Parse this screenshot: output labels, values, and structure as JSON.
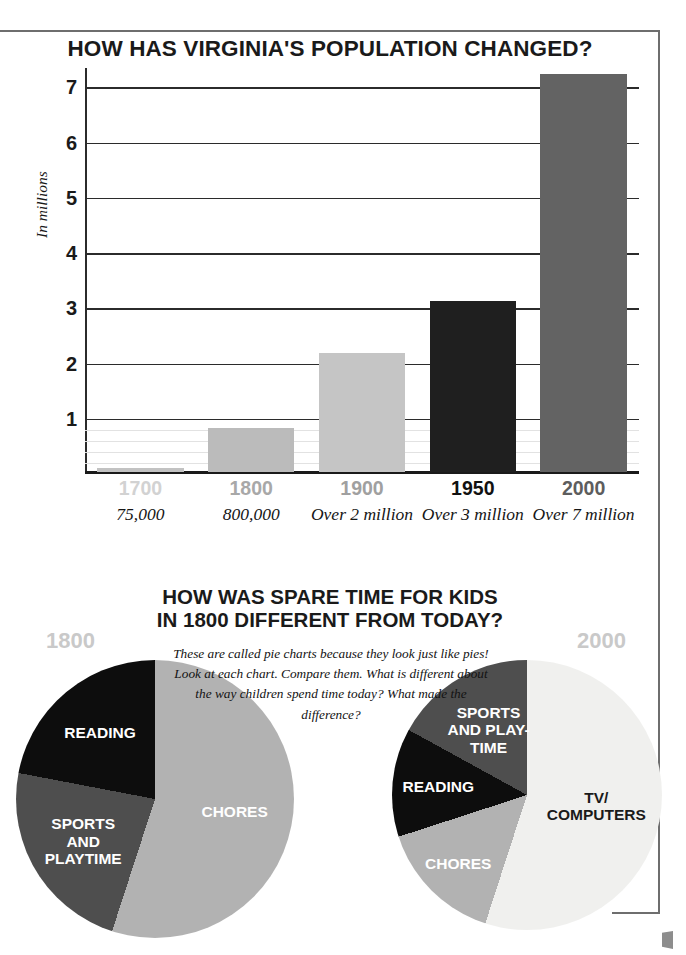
{
  "bar_section": {
    "title": "HOW HAS VIRGINIA'S POPULATION CHANGED?",
    "ylabel": "In millions"
  },
  "pie_section": {
    "title_line1": "HOW WAS SPARE TIME FOR KIDS",
    "title_line2": "IN 1800 DIFFERENT FROM TODAY?",
    "note": "These are called pie charts because they look just like pies! Look at each chart. Compare them. What is different about the way children spend time today? What made the difference?",
    "left_year": "1800",
    "right_year": "2000"
  },
  "chart_data": [
    {
      "type": "bar",
      "title": "HOW HAS VIRGINIA'S POPULATION CHANGED?",
      "xlabel": "",
      "ylabel": "In millions",
      "ylim": [
        0,
        7.35
      ],
      "yticks": [
        1,
        2,
        3,
        4,
        5,
        6,
        7
      ],
      "grid": true,
      "categories": [
        "1700",
        "1800",
        "1900",
        "1950",
        "2000"
      ],
      "values": [
        0.075,
        0.8,
        2.15,
        3.1,
        7.2
      ],
      "value_labels": [
        "75,000",
        "800,000",
        "Over 2 million",
        "Over 3 million",
        "Over 7 million"
      ],
      "bar_colors": [
        "#c2c2c2",
        "#bbbbbb",
        "#c5c5c5",
        "#1f1f1f",
        "#636363"
      ],
      "tick_label_colors": [
        "#d2d2d2",
        "#a8a8a8",
        "#a0a0a0",
        "#111111",
        "#5d5d5d"
      ]
    },
    {
      "type": "pie",
      "title": "1800",
      "labels": [
        "CHORES",
        "SPORTS AND PLAYTIME",
        "READING"
      ],
      "values": [
        55,
        23,
        22
      ],
      "colors": [
        "#b2b2b2",
        "#4e4e4e",
        "#0d0d0d"
      ],
      "label_colors": [
        "#ffffff",
        "#ffffff",
        "#ffffff"
      ]
    },
    {
      "type": "pie",
      "title": "2000",
      "labels": [
        "TV/ COMPUTERS",
        "CHORES",
        "READING",
        "SPORTS AND PLAY-TIME"
      ],
      "values": [
        55,
        15,
        13,
        17
      ],
      "colors": [
        "#f0f0ee",
        "#b2b2b2",
        "#0d0d0d",
        "#4e4e4e"
      ],
      "label_colors": [
        "#1a1a1a",
        "#ffffff",
        "#ffffff",
        "#ffffff"
      ]
    }
  ],
  "pies": {
    "left": {
      "year": "1800",
      "slices": [
        {
          "label": "CHORES",
          "value": 55
        },
        {
          "label": "SPORTS\nAND\nPLAYTIME",
          "value": 23
        },
        {
          "label": "READING",
          "value": 22
        }
      ]
    },
    "right": {
      "year": "2000",
      "slices": [
        {
          "label": "TV/\nCOMPUTERS",
          "value": 55
        },
        {
          "label": "CHORES",
          "value": 15
        },
        {
          "label": "READING",
          "value": 13
        },
        {
          "label": "SPORTS\nAND PLAY-\nTIME",
          "value": 17
        }
      ]
    }
  }
}
